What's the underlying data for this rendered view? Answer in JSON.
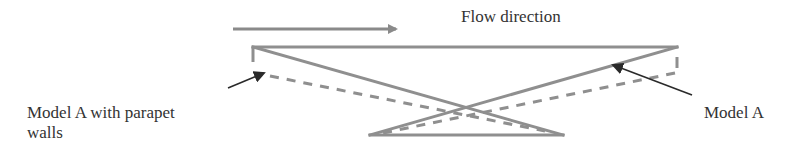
{
  "diagram": {
    "type": "schematic",
    "labels": {
      "flow_direction": "Flow direction",
      "model_a_parapet_line1": "Model A with parapet",
      "model_a_parapet_line2": "walls",
      "model_a": "Model A"
    },
    "colors": {
      "solid_line": "#8a8a8a",
      "dashed_line": "#8a8a8a",
      "pointer_arrow": "#2a2a2a",
      "text": "#333333"
    },
    "elements": [
      {
        "id": "flow-arrow",
        "kind": "arrow",
        "from": [
          233,
          29
        ],
        "to": [
          396,
          29
        ]
      },
      {
        "id": "deck-top",
        "kind": "solid-line",
        "from": [
          253,
          47
        ],
        "to": [
          677,
          47
        ]
      },
      {
        "id": "model-a-left-diagonal",
        "kind": "solid-line",
        "from": [
          253,
          47
        ],
        "to": [
          563,
          135
        ]
      },
      {
        "id": "model-a-right-diagonal",
        "kind": "solid-line",
        "from": [
          677,
          47
        ],
        "to": [
          370,
          135
        ]
      },
      {
        "id": "base",
        "kind": "solid-line",
        "from": [
          370,
          135
        ],
        "to": [
          563,
          135
        ]
      },
      {
        "id": "left-parapet",
        "kind": "dashed-line",
        "from": [
          253,
          47
        ],
        "to": [
          253,
          72
        ]
      },
      {
        "id": "right-parapet",
        "kind": "dashed-line",
        "from": [
          677,
          57
        ],
        "to": [
          677,
          72
        ]
      },
      {
        "id": "parapet-left-diagonal",
        "kind": "dashed-line",
        "from": [
          262,
          75
        ],
        "to": [
          540,
          130
        ]
      },
      {
        "id": "parapet-right-diagonal",
        "kind": "dashed-line",
        "from": [
          677,
          72
        ],
        "to": [
          385,
          132
        ]
      },
      {
        "id": "pointer-parapet",
        "kind": "pointer",
        "from": [
          228,
          88
        ],
        "to": [
          264,
          73
        ]
      },
      {
        "id": "pointer-model-a",
        "kind": "pointer",
        "from": [
          692,
          95
        ],
        "to": [
          613,
          65
        ]
      }
    ]
  }
}
